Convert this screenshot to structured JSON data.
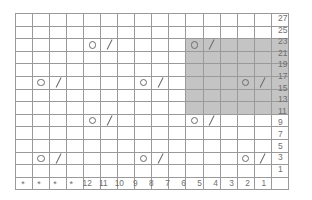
{
  "chart_data": {
    "type": "table",
    "xlabel": "",
    "ylabel": "",
    "grid": true,
    "legend_position": "none",
    "columns": 16,
    "rows": 14,
    "column_labels": [
      "*",
      "*",
      "*",
      "*",
      "12",
      "11",
      "10",
      "9",
      "8",
      "7",
      "6",
      "5",
      "4",
      "3",
      "2",
      "1"
    ],
    "row_labels": [
      "27",
      "25",
      "23",
      "21",
      "19",
      "17",
      "15",
      "13",
      "11",
      "9",
      "7",
      "5",
      "3",
      "1"
    ],
    "symbols": {
      "yarn-over": "O",
      "decrease": "\\",
      "blank": ""
    },
    "colors": {
      "grid_line": "#9a9a9a",
      "shade": "#c4c4c4",
      "symbol": "#6d6d6d",
      "label_text": "#6f6f6f",
      "background": "#ffffff"
    },
    "shaded_region": {
      "row_labels": [
        "23",
        "21",
        "19",
        "17",
        "15",
        "13"
      ],
      "column_labels": [
        "6",
        "5",
        "4",
        "3",
        "2",
        "1"
      ],
      "row_index_start": 2,
      "row_index_end": 7,
      "col_index_start": 10,
      "col_index_end": 15
    },
    "cells": [
      [
        "",
        "",
        "",
        "",
        "",
        "",
        "",
        "",
        "",
        "",
        "",
        "",
        "",
        "",
        "",
        ""
      ],
      [
        "",
        "",
        "",
        "",
        "",
        "",
        "",
        "",
        "",
        "",
        "",
        "",
        "",
        "",
        "",
        ""
      ],
      [
        "",
        "",
        "",
        "",
        "O",
        "\\",
        "",
        "",
        "",
        "",
        "O",
        "\\",
        "",
        "",
        "",
        ""
      ],
      [
        "",
        "",
        "",
        "",
        "",
        "",
        "",
        "",
        "",
        "",
        "",
        "",
        "",
        "",
        "",
        ""
      ],
      [
        "",
        "",
        "",
        "",
        "",
        "",
        "",
        "",
        "",
        "",
        "",
        "",
        "",
        "",
        "",
        ""
      ],
      [
        "",
        "O",
        "\\",
        "",
        "",
        "",
        "",
        "O",
        "\\",
        "",
        "",
        "",
        "",
        "O",
        "\\",
        ""
      ],
      [
        "",
        "",
        "",
        "",
        "",
        "",
        "",
        "",
        "",
        "",
        "",
        "",
        "",
        "",
        "",
        ""
      ],
      [
        "",
        "",
        "",
        "",
        "",
        "",
        "",
        "",
        "",
        "",
        "",
        "",
        "",
        "",
        "",
        ""
      ],
      [
        "",
        "",
        "",
        "",
        "O",
        "\\",
        "",
        "",
        "",
        "",
        "O",
        "\\",
        "",
        "",
        "",
        ""
      ],
      [
        "",
        "",
        "",
        "",
        "",
        "",
        "",
        "",
        "",
        "",
        "",
        "",
        "",
        "",
        "",
        ""
      ],
      [
        "",
        "",
        "",
        "",
        "",
        "",
        "",
        "",
        "",
        "",
        "",
        "",
        "",
        "",
        "",
        ""
      ],
      [
        "",
        "O",
        "\\",
        "",
        "",
        "",
        "",
        "O",
        "\\",
        "",
        "",
        "",
        "",
        "O",
        "\\",
        ""
      ],
      [
        "",
        "",
        "",
        "",
        "",
        "",
        "",
        "",
        "",
        "",
        "",
        "",
        "",
        "",
        "",
        ""
      ],
      [
        "",
        "",
        "",
        "",
        "",
        "",
        "",
        "",
        "",
        "",
        "",
        "",
        "",
        "",
        "",
        ""
      ]
    ]
  }
}
